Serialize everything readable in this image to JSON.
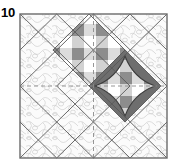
{
  "figure": {
    "label": "10",
    "caption_label_position": "top-left",
    "type": "quilt-block-diagram",
    "block": {
      "name": "square-in-a-square-on-point",
      "x": 20,
      "y": 14,
      "width": 147,
      "height": 144,
      "grid": "4x4 quarter-square triangle units",
      "border_color": "#6b6b6b",
      "background_fill": "#fafafa",
      "background_texture": "stipple-meander-quilting",
      "texture_color": "#c9c9c9",
      "seam_line_color": "#585858",
      "center_guide_style": "dashed",
      "center_guide_color": "#8a8a8a"
    },
    "patches": [
      {
        "id": "patch-gingham-upper",
        "shape": "on-point-square",
        "center_x": 89,
        "center_y": 50,
        "half_diagonal": 36,
        "fabric": "gingham-check",
        "fabric_light": "#ffffff",
        "fabric_mid": "#cfcfcf",
        "fabric_dark": "#8f8f8f",
        "check_count": 6,
        "shaded": false
      },
      {
        "id": "patch-gingham-lower-right",
        "shape": "on-point-square",
        "center_x": 125,
        "center_y": 86,
        "half_diagonal": 36,
        "fabric": "gingham-check",
        "fabric_light": "#ffffff",
        "fabric_mid": "#cfcfcf",
        "fabric_dark": "#8f8f8f",
        "check_count": 6,
        "shaded": true,
        "shadow_color": "#6e6e6e",
        "shadow_shape": "concave-scalloped-corners"
      }
    ],
    "colors": {
      "outline": "#6b6b6b",
      "seam": "#585858",
      "dashed_guide": "#8a8a8a",
      "shadow": "#6e6e6e",
      "label_text": "#000000",
      "page_background": "#ffffff"
    }
  }
}
